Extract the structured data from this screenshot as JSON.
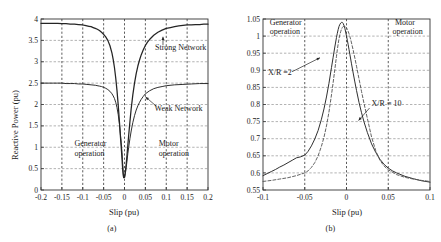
{
  "figure": {
    "panels": [
      {
        "id": "a",
        "caption": "(a)",
        "xlabel": "Slip (pu)",
        "ylabel": "Reactive Power (pu)"
      },
      {
        "id": "b",
        "caption": "(b)",
        "xlabel": "Slip (pu)",
        "ylabel": "Voltage of POC"
      }
    ]
  },
  "chart_data": [
    {
      "type": "line",
      "panel": "(a)",
      "title": "",
      "xlabel": "Slip (pu)",
      "ylabel": "Reactive Power (pu)",
      "xlim": [
        -0.2,
        0.2
      ],
      "ylim": [
        0,
        4
      ],
      "xticks": [
        -0.2,
        -0.15,
        -0.1,
        -0.05,
        0,
        0.05,
        0.1,
        0.15,
        0.2
      ],
      "xticklabels": [
        "-0.2",
        "-0.15",
        "-0.1",
        "-0.05",
        "0",
        "0.05",
        "0.1",
        "0.15",
        "0.2"
      ],
      "yticks": [
        0,
        0.5,
        1,
        1.5,
        2,
        2.5,
        3,
        3.5,
        4
      ],
      "yticklabels": [
        "0",
        "0.5",
        "1",
        "1.5",
        "2",
        "2.5",
        "3",
        "3.5",
        "4"
      ],
      "grid": true,
      "legend": "none",
      "annotations": [
        {
          "text": "Strong Network",
          "x": 0.073,
          "y": 3.28,
          "arrow": "up"
        },
        {
          "text": "Weak Network",
          "x": 0.072,
          "y": 1.85,
          "arrow": "up-left"
        },
        {
          "text": "Generator",
          "x": -0.12,
          "y": 1.02,
          "arrow": "none"
        },
        {
          "text": "operation",
          "x": -0.12,
          "y": 0.8,
          "arrow": "none"
        },
        {
          "text": "Motor",
          "x": 0.082,
          "y": 1.02,
          "arrow": "none"
        },
        {
          "text": "operation",
          "x": 0.082,
          "y": 0.8,
          "arrow": "none"
        }
      ],
      "series": [
        {
          "name": "Strong Network",
          "x": [
            -0.2,
            -0.19,
            -0.18,
            -0.17,
            -0.16,
            -0.15,
            -0.14,
            -0.13,
            -0.12,
            -0.11,
            -0.1,
            -0.095,
            -0.09,
            -0.085,
            -0.08,
            -0.075,
            -0.07,
            -0.065,
            -0.06,
            -0.055,
            -0.05,
            -0.045,
            -0.04,
            -0.035,
            -0.03,
            -0.027,
            -0.024,
            -0.021,
            -0.018,
            -0.015,
            -0.012,
            -0.01,
            -0.008,
            -0.006,
            -0.005,
            -0.004,
            -0.003,
            -0.002,
            0,
            0.002,
            0.004,
            0.006,
            0.008,
            0.01,
            0.013,
            0.016,
            0.02,
            0.024,
            0.028,
            0.032,
            0.036,
            0.04,
            0.045,
            0.05,
            0.055,
            0.06,
            0.07,
            0.08,
            0.09,
            0.1,
            0.11,
            0.12,
            0.13,
            0.14,
            0.15,
            0.16,
            0.17,
            0.18,
            0.19,
            0.2
          ],
          "y": [
            3.9,
            3.9,
            3.9,
            3.9,
            3.9,
            3.89,
            3.89,
            3.88,
            3.88,
            3.87,
            3.86,
            3.85,
            3.84,
            3.83,
            3.82,
            3.8,
            3.78,
            3.76,
            3.73,
            3.69,
            3.64,
            3.58,
            3.5,
            3.38,
            3.2,
            3.05,
            2.86,
            2.62,
            2.33,
            1.98,
            1.58,
            1.28,
            1.02,
            0.74,
            0.58,
            0.44,
            0.34,
            0.29,
            0.3,
            0.42,
            0.6,
            0.82,
            1.05,
            1.28,
            1.6,
            1.9,
            2.23,
            2.5,
            2.72,
            2.9,
            3.04,
            3.16,
            3.28,
            3.38,
            3.46,
            3.52,
            3.62,
            3.69,
            3.74,
            3.78,
            3.8,
            3.82,
            3.84,
            3.85,
            3.86,
            3.86,
            3.87,
            3.87,
            3.88,
            3.88
          ]
        },
        {
          "name": "Weak Network",
          "x": [
            -0.2,
            -0.19,
            -0.18,
            -0.17,
            -0.16,
            -0.15,
            -0.14,
            -0.13,
            -0.12,
            -0.11,
            -0.1,
            -0.09,
            -0.08,
            -0.07,
            -0.06,
            -0.055,
            -0.05,
            -0.045,
            -0.04,
            -0.035,
            -0.03,
            -0.027,
            -0.024,
            -0.021,
            -0.018,
            -0.015,
            -0.012,
            -0.01,
            -0.008,
            -0.006,
            -0.005,
            -0.004,
            -0.003,
            -0.002,
            0,
            0.002,
            0.004,
            0.006,
            0.008,
            0.01,
            0.013,
            0.016,
            0.02,
            0.024,
            0.028,
            0.032,
            0.036,
            0.04,
            0.045,
            0.05,
            0.06,
            0.07,
            0.08,
            0.09,
            0.1,
            0.12,
            0.14,
            0.16,
            0.18,
            0.2
          ],
          "y": [
            2.5,
            2.5,
            2.5,
            2.5,
            2.5,
            2.5,
            2.49,
            2.49,
            2.49,
            2.48,
            2.48,
            2.47,
            2.46,
            2.45,
            2.43,
            2.42,
            2.4,
            2.38,
            2.35,
            2.31,
            2.25,
            2.2,
            2.14,
            2.05,
            1.93,
            1.76,
            1.53,
            1.32,
            1.12,
            0.88,
            0.72,
            0.56,
            0.4,
            0.3,
            0.28,
            0.38,
            0.52,
            0.68,
            0.85,
            1.0,
            1.2,
            1.38,
            1.58,
            1.74,
            1.87,
            1.97,
            2.05,
            2.12,
            2.19,
            2.25,
            2.32,
            2.37,
            2.4,
            2.42,
            2.44,
            2.46,
            2.47,
            2.48,
            2.49,
            2.49
          ]
        }
      ]
    },
    {
      "type": "line",
      "panel": "(b)",
      "title": "",
      "xlabel": "Slip (pu)",
      "ylabel": "Voltage of POC",
      "xlim": [
        -0.1,
        0.1
      ],
      "ylim": [
        0.55,
        1.05
      ],
      "xticks": [
        -0.1,
        -0.05,
        0,
        0.05,
        0.1
      ],
      "xticklabels": [
        "-0.1",
        "-0.05",
        "0",
        "0.05",
        "0.1"
      ],
      "yticks": [
        0.55,
        0.6,
        0.65,
        0.7,
        0.75,
        0.8,
        0.85,
        0.9,
        0.95,
        1,
        1.05
      ],
      "yticklabels": [
        "0.55",
        "0.6",
        "0.65",
        "0.7",
        "0.75",
        "0.8",
        "0.85",
        "0.9",
        "0.95",
        "1",
        "1.05"
      ],
      "grid": true,
      "legend": "none",
      "annotations": [
        {
          "text": "Generator",
          "x": -0.092,
          "y": 1.032,
          "arrow": "none"
        },
        {
          "text": "operation",
          "x": -0.092,
          "y": 1.006,
          "arrow": "none"
        },
        {
          "text": "Motor",
          "x": 0.058,
          "y": 1.032,
          "arrow": "none"
        },
        {
          "text": "operation",
          "x": 0.055,
          "y": 1.006,
          "arrow": "none"
        },
        {
          "text": "X/R =2",
          "x": -0.094,
          "y": 0.887,
          "arrow": "up-right"
        },
        {
          "text": "X/R = 10",
          "x": 0.03,
          "y": 0.797,
          "arrow": "down-left"
        }
      ],
      "series": [
        {
          "name": "X/R = 10",
          "x": [
            -0.1,
            -0.095,
            -0.09,
            -0.085,
            -0.08,
            -0.075,
            -0.07,
            -0.065,
            -0.06,
            -0.055,
            -0.05,
            -0.046,
            -0.042,
            -0.038,
            -0.034,
            -0.03,
            -0.027,
            -0.024,
            -0.021,
            -0.018,
            -0.016,
            -0.014,
            -0.012,
            -0.011,
            -0.01,
            -0.009,
            -0.008,
            -0.007,
            -0.006,
            -0.005,
            -0.004,
            -0.003,
            -0.002,
            -0.001,
            0,
            0.001,
            0.002,
            0.003,
            0.004,
            0.005,
            0.006,
            0.008,
            0.01,
            0.012,
            0.015,
            0.018,
            0.021,
            0.025,
            0.03,
            0.035,
            0.04,
            0.045,
            0.05,
            0.055,
            0.06,
            0.07,
            0.08,
            0.09,
            0.1
          ],
          "y": [
            0.592,
            0.598,
            0.604,
            0.61,
            0.617,
            0.623,
            0.63,
            0.637,
            0.644,
            0.647,
            0.652,
            0.663,
            0.679,
            0.699,
            0.724,
            0.757,
            0.787,
            0.822,
            0.862,
            0.908,
            0.938,
            0.968,
            0.996,
            1.008,
            1.019,
            1.028,
            1.034,
            1.038,
            1.04,
            1.04,
            1.037,
            1.031,
            1.023,
            1.012,
            1.0,
            0.988,
            0.975,
            0.961,
            0.947,
            0.933,
            0.919,
            0.892,
            0.866,
            0.841,
            0.806,
            0.776,
            0.749,
            0.718,
            0.685,
            0.66,
            0.64,
            0.625,
            0.614,
            0.606,
            0.6,
            0.59,
            0.583,
            0.577,
            0.573
          ]
        },
        {
          "name": "X/R = 2",
          "x": [
            -0.1,
            -0.09,
            -0.08,
            -0.07,
            -0.06,
            -0.055,
            -0.05,
            -0.046,
            -0.042,
            -0.038,
            -0.034,
            -0.03,
            -0.027,
            -0.024,
            -0.021,
            -0.018,
            -0.016,
            -0.014,
            -0.012,
            -0.011,
            -0.01,
            -0.009,
            -0.008,
            -0.007,
            -0.006,
            -0.005,
            -0.004,
            -0.003,
            -0.002,
            -0.001,
            0,
            0.001,
            0.002,
            0.003,
            0.004,
            0.005,
            0.006,
            0.008,
            0.01,
            0.012,
            0.015,
            0.018,
            0.021,
            0.025,
            0.03,
            0.035,
            0.04,
            0.045,
            0.05,
            0.06,
            0.07,
            0.08,
            0.09,
            0.1
          ],
          "y": [
            0.575,
            0.578,
            0.582,
            0.586,
            0.592,
            0.596,
            0.6,
            0.606,
            0.616,
            0.63,
            0.65,
            0.678,
            0.704,
            0.737,
            0.778,
            0.828,
            0.864,
            0.902,
            0.941,
            0.96,
            0.977,
            0.992,
            1.004,
            1.013,
            1.02,
            1.025,
            1.028,
            1.029,
            1.029,
            1.027,
            1.024,
            1.02,
            1.014,
            1.007,
            0.999,
            0.99,
            0.98,
            0.959,
            0.936,
            0.912,
            0.875,
            0.838,
            0.803,
            0.759,
            0.705,
            0.665,
            0.637,
            0.62,
            0.609,
            0.595,
            0.587,
            0.582,
            0.578,
            0.575
          ]
        }
      ]
    }
  ]
}
